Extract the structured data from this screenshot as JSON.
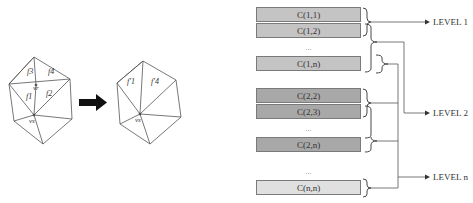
{
  "mesh_transform": {
    "before": {
      "face_labels": [
        "f3",
        "f4",
        "f1",
        "f2"
      ],
      "vertex_labels": [
        "vr",
        "vs"
      ]
    },
    "arrow": "right-arrow",
    "after": {
      "face_labels": [
        "f'1",
        "f'4"
      ],
      "vertex_labels": [
        "vs"
      ]
    }
  },
  "hierarchy": {
    "groups": [
      {
        "color": "#c4c4c4",
        "cells": [
          "C(1,1)",
          "C(1,2)",
          "...",
          "C(1,n)"
        ]
      },
      {
        "color": "#a8a8a8",
        "cells": [
          "C(2,2)",
          "C(2,3)",
          "...",
          "C(2,n)"
        ]
      },
      {
        "color": "#e0e0e0",
        "cells": [
          "...",
          "C(n,n)"
        ]
      }
    ],
    "levels": [
      "LEVEL 1",
      "LEVEL 2",
      "LEVEL n"
    ]
  }
}
